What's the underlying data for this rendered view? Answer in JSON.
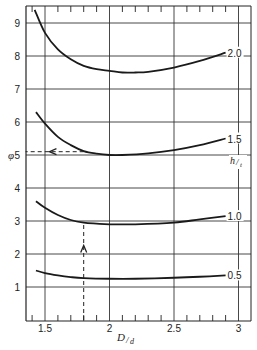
{
  "chart_data": {
    "type": "line",
    "title": "",
    "xlabel": "D/d",
    "ylabel": "φ",
    "xlim": [
      1.35,
      3.09
    ],
    "ylim": [
      0,
      9.4
    ],
    "x_ticks": [
      1.5,
      2,
      2.5,
      3
    ],
    "x_tick_labels": [
      "1.5",
      "2",
      "2.5",
      "3"
    ],
    "x_minor_step": 0.1,
    "y_ticks": [
      1,
      2,
      3,
      4,
      5,
      6,
      7,
      8,
      9
    ],
    "y_tick_labels": [
      "1",
      "2",
      "3",
      "4",
      "5",
      "6",
      "7",
      "8",
      "9"
    ],
    "grid": true,
    "legend_title": "h/t",
    "legend_position": "right, curve-end labels",
    "series": [
      {
        "name": "2.0",
        "x": [
          1.42,
          1.5,
          1.6,
          1.7,
          1.8,
          1.9,
          2.0,
          2.1,
          2.2,
          2.3,
          2.5,
          2.7,
          2.9
        ],
        "values": [
          9.4,
          8.7,
          8.2,
          7.9,
          7.7,
          7.6,
          7.55,
          7.5,
          7.5,
          7.52,
          7.65,
          7.85,
          8.1
        ]
      },
      {
        "name": "1.5",
        "x": [
          1.43,
          1.5,
          1.6,
          1.7,
          1.8,
          1.9,
          2.0,
          2.1,
          2.3,
          2.5,
          2.7,
          2.9
        ],
        "values": [
          6.3,
          5.95,
          5.55,
          5.3,
          5.12,
          5.04,
          5.0,
          5.0,
          5.05,
          5.15,
          5.3,
          5.5
        ]
      },
      {
        "name": "1.0",
        "x": [
          1.43,
          1.5,
          1.6,
          1.7,
          1.8,
          1.9,
          2.0,
          2.2,
          2.5,
          2.7,
          2.9
        ],
        "values": [
          3.6,
          3.4,
          3.18,
          3.03,
          2.95,
          2.92,
          2.9,
          2.9,
          2.95,
          3.05,
          3.15
        ]
      },
      {
        "name": "0.5",
        "x": [
          1.43,
          1.5,
          1.6,
          1.7,
          1.8,
          2.0,
          2.2,
          2.5,
          2.7,
          2.9
        ],
        "values": [
          1.5,
          1.42,
          1.35,
          1.3,
          1.27,
          1.25,
          1.25,
          1.28,
          1.31,
          1.35
        ]
      }
    ],
    "annotations": [
      {
        "type": "dashed-vertical-arrow",
        "x": 1.8,
        "from_y": 0,
        "to_y": 2.95,
        "arrow_at_y": 2.2,
        "direction": "up"
      },
      {
        "type": "dashed-horizontal-arrow",
        "y": 5.1,
        "from_x": 1.8,
        "to_x": 1.35,
        "arrow_at_x": 1.55,
        "direction": "left"
      }
    ]
  },
  "labels": {
    "y_axis": "φ",
    "x_axis_main": "D",
    "x_axis_sub": "d",
    "legend_main": "h",
    "legend_sub": "t"
  }
}
